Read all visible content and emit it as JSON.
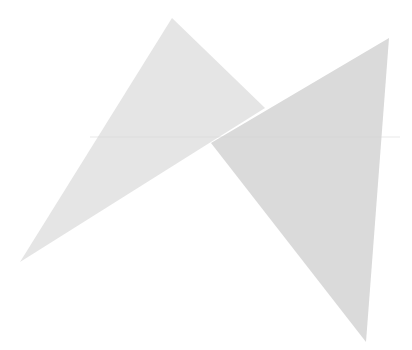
{
  "figure": {
    "background": "#ffffff",
    "width": 412,
    "height": 350,
    "shapes": [
      {
        "name": "left-triangle",
        "points": [
          [
            172,
            18
          ],
          [
            265,
            108
          ],
          [
            20,
            262
          ]
        ],
        "fill": "#e5e5e5"
      },
      {
        "name": "right-triangle",
        "points": [
          [
            389,
            38
          ],
          [
            366,
            342
          ],
          [
            211,
            143
          ]
        ],
        "fill": "#dadada"
      }
    ],
    "guide_line": {
      "y": 137,
      "x1": 90,
      "x2": 400,
      "color": "#d4d4d4"
    }
  }
}
